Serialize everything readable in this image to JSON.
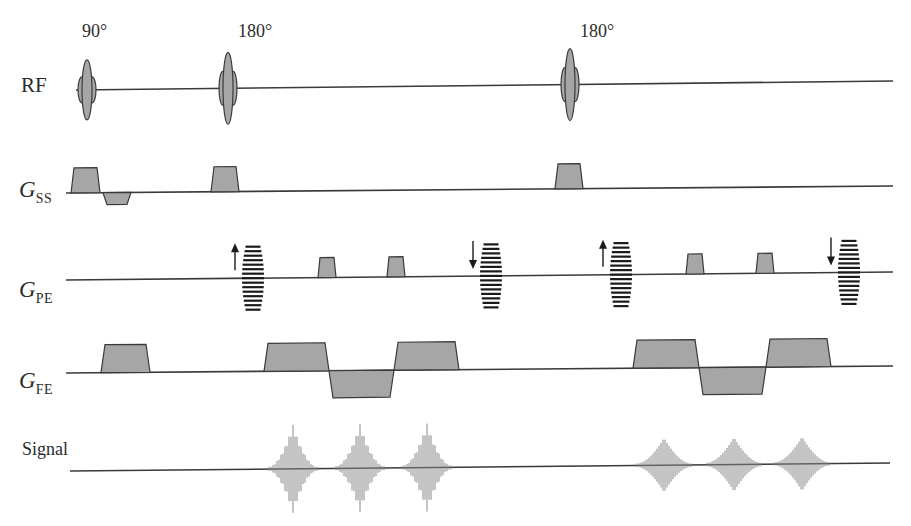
{
  "diagram": {
    "colors": {
      "line": "#3a3a3a",
      "fill": "#a6a6a6",
      "signal": "#8a8a8a",
      "text": "#2b2b2b",
      "background": "#ffffff"
    },
    "flip_angles": [
      {
        "label": "90°",
        "x": 104
      },
      {
        "label": "180°",
        "x": 254
      },
      {
        "label": "180°",
        "x": 597
      }
    ],
    "rows": [
      {
        "id": "rf",
        "label": "RF",
        "symbol": "",
        "subscript": ""
      },
      {
        "id": "gss",
        "label": "",
        "symbol": "G",
        "subscript": "SS"
      },
      {
        "id": "gpe",
        "label": "",
        "symbol": "G",
        "subscript": "PE"
      },
      {
        "id": "gfe",
        "label": "",
        "symbol": "G",
        "subscript": "FE"
      },
      {
        "id": "signal",
        "label": "Signal",
        "symbol": "",
        "subscript": ""
      }
    ],
    "rf_pulses": [
      {
        "type": "90",
        "x": 87
      },
      {
        "type": "180",
        "x": 228
      },
      {
        "type": "180",
        "x": 570
      }
    ],
    "gss_lobes": [
      {
        "x1": 71,
        "x2": 100,
        "polarity": "positive"
      },
      {
        "x1": 103,
        "x2": 131,
        "polarity": "negative"
      },
      {
        "x1": 211,
        "x2": 239,
        "polarity": "positive"
      },
      {
        "x1": 555,
        "x2": 583,
        "polarity": "positive"
      }
    ],
    "gpe_events": [
      {
        "type": "phase_table",
        "x": 253,
        "direction": "up"
      },
      {
        "type": "blip",
        "x": 327
      },
      {
        "type": "blip",
        "x": 396
      },
      {
        "type": "phase_table",
        "x": 491,
        "direction": "down"
      },
      {
        "type": "phase_table",
        "x": 621,
        "direction": "up"
      },
      {
        "type": "blip",
        "x": 695
      },
      {
        "type": "blip",
        "x": 765
      },
      {
        "type": "phase_table",
        "x": 849,
        "direction": "down"
      }
    ],
    "gfe_lobes": [
      {
        "x1": 101,
        "x2": 150,
        "polarity": "positive"
      },
      {
        "x1": 264,
        "x2": 329,
        "polarity": "positive"
      },
      {
        "x1": 329,
        "x2": 394,
        "polarity": "negative"
      },
      {
        "x1": 394,
        "x2": 459,
        "polarity": "positive"
      },
      {
        "x1": 633,
        "x2": 699,
        "polarity": "positive"
      },
      {
        "x1": 699,
        "x2": 766,
        "polarity": "negative"
      },
      {
        "x1": 766,
        "x2": 831,
        "polarity": "positive"
      }
    ],
    "echoes": [
      {
        "x": 293
      },
      {
        "x": 360
      },
      {
        "x": 427
      },
      {
        "x": 664
      },
      {
        "x": 734
      },
      {
        "x": 802
      }
    ]
  }
}
